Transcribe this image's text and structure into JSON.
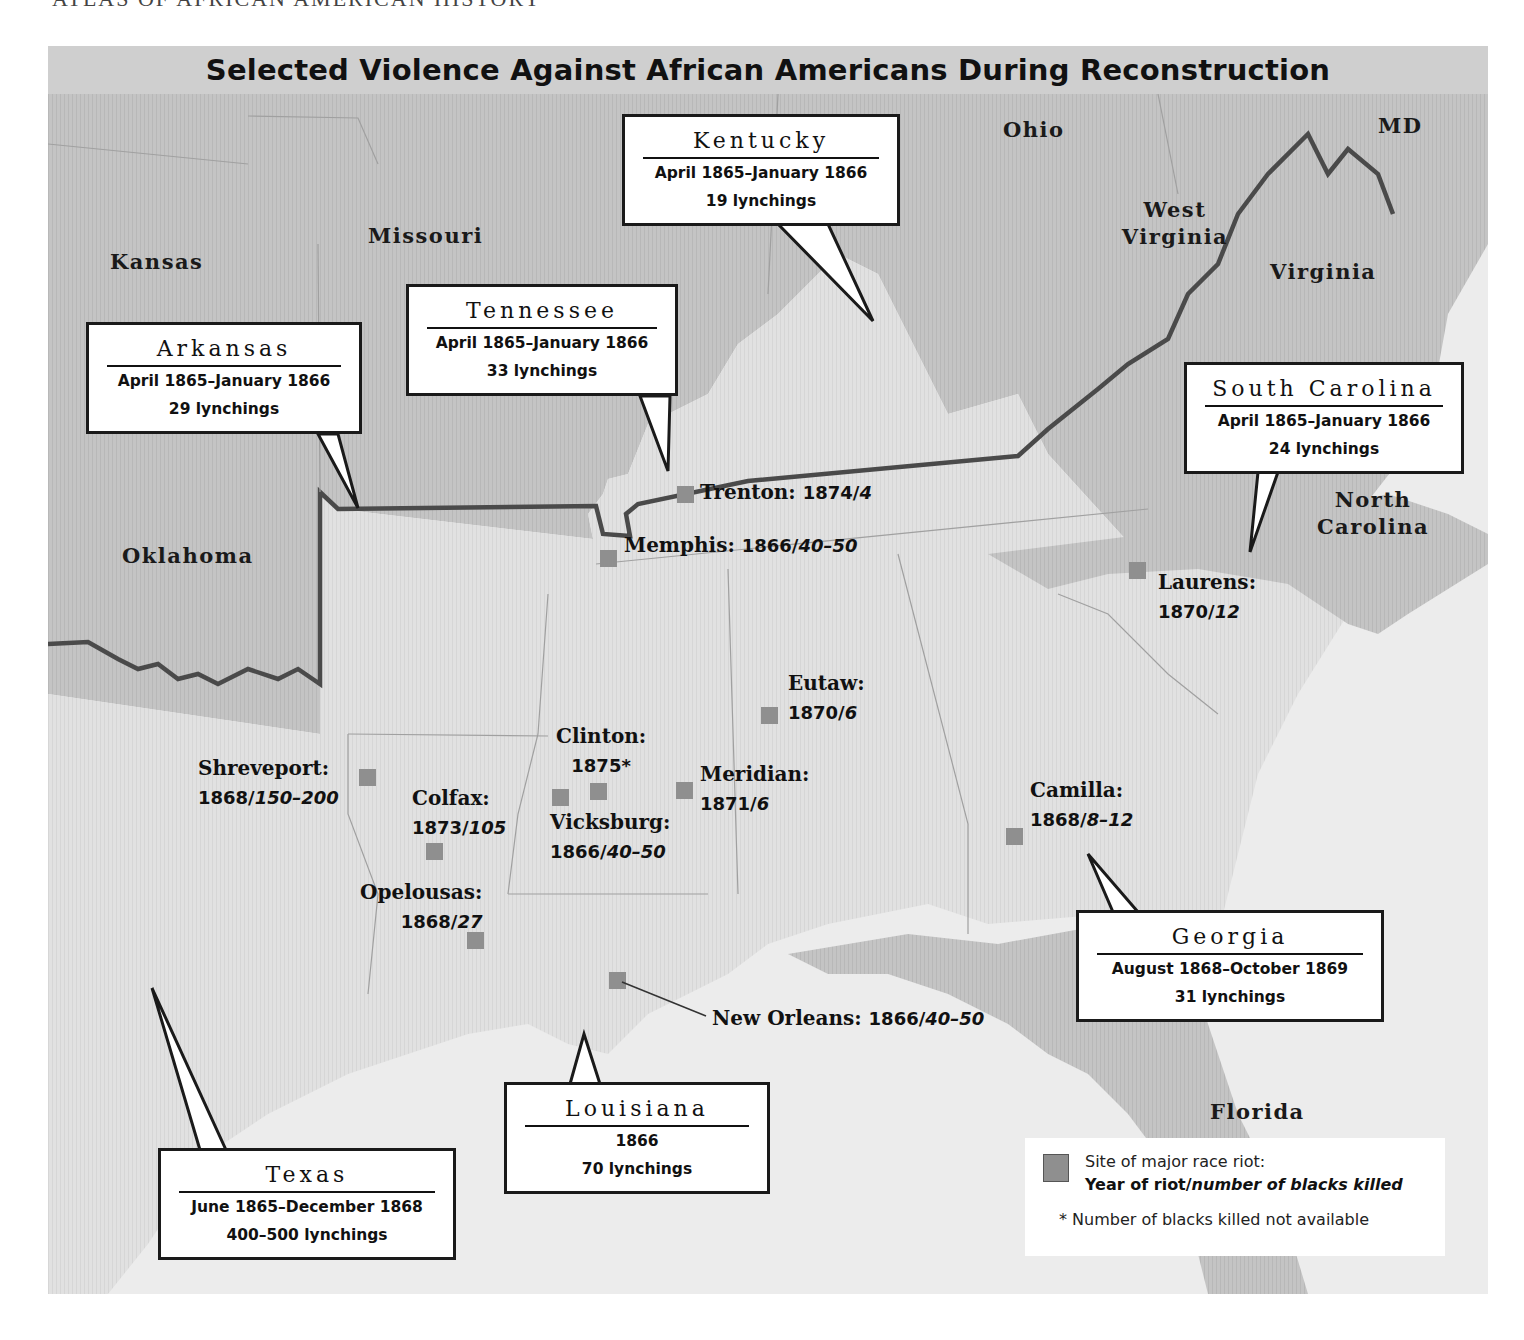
{
  "page": {
    "running_head": "ATLAS OF AFRICAN AMERICAN HISTORY"
  },
  "map": {
    "title": "Selected Violence Against African Americans During Reconstruction",
    "colors": {
      "union_states": "#c2c2c2",
      "former_confederacy": "#e1e1e1",
      "ocean": "#ececec",
      "riot_marker": "#8f8f8f",
      "border_line": "#4a4a4a"
    },
    "state_labels": [
      {
        "id": "kansas",
        "text": "Kansas"
      },
      {
        "id": "missouri",
        "text": "Missouri"
      },
      {
        "id": "ohio",
        "text": "Ohio"
      },
      {
        "id": "md",
        "text": "MD"
      },
      {
        "id": "west-virginia",
        "text": "West Virginia"
      },
      {
        "id": "virginia",
        "text": "Virginia"
      },
      {
        "id": "oklahoma",
        "text": "Oklahoma"
      },
      {
        "id": "north-carolina",
        "text": "North Carolina"
      },
      {
        "id": "florida",
        "text": "Florida"
      }
    ],
    "callouts": [
      {
        "id": "kentucky",
        "state": "Kentucky",
        "period": "April 1865–January 1866",
        "count": "19 lynchings"
      },
      {
        "id": "tennessee",
        "state": "Tennessee",
        "period": "April 1865–January 1866",
        "count": "33 lynchings"
      },
      {
        "id": "arkansas",
        "state": "Arkansas",
        "period": "April 1865–January 1866",
        "count": "29 lynchings"
      },
      {
        "id": "south-carolina",
        "state": "South Carolina",
        "period": "April 1865–January 1866",
        "count": "24 lynchings"
      },
      {
        "id": "georgia",
        "state": "Georgia",
        "period": "August 1868–October 1869",
        "count": "31 lynchings"
      },
      {
        "id": "louisiana",
        "state": "Louisiana",
        "period": "1866",
        "count": "70 lynchings"
      },
      {
        "id": "texas",
        "state": "Texas",
        "period": "June 1865–December 1868",
        "count": "400–500 lynchings"
      }
    ],
    "riot_sites": [
      {
        "id": "trenton",
        "name": "Trenton:",
        "year": "1874/",
        "killed": "4"
      },
      {
        "id": "memphis",
        "name": "Memphis:",
        "year": "1866/",
        "killed": "40–50"
      },
      {
        "id": "laurens",
        "name": "Laurens:",
        "year": "1870/",
        "killed": "12"
      },
      {
        "id": "eutaw",
        "name": "Eutaw:",
        "year": "1870/",
        "killed": "6"
      },
      {
        "id": "clinton",
        "name": "Clinton:",
        "year": "1875*",
        "killed": ""
      },
      {
        "id": "meridian",
        "name": "Meridian:",
        "year": "1871/",
        "killed": "6"
      },
      {
        "id": "shreveport",
        "name": "Shreveport:",
        "year": "1868/",
        "killed": "150–200"
      },
      {
        "id": "colfax",
        "name": "Colfax:",
        "year": "1873/",
        "killed": "105"
      },
      {
        "id": "vicksburg",
        "name": "Vicksburg:",
        "year": "1866/",
        "killed": "40–50"
      },
      {
        "id": "camilla",
        "name": "Camilla:",
        "year": "1868/",
        "killed": "8–12"
      },
      {
        "id": "opelousas",
        "name": "Opelousas:",
        "year": "1868/",
        "killed": "27"
      },
      {
        "id": "new-orleans",
        "name": "New Orleans:",
        "year": "1866/",
        "killed": "40–50"
      }
    ],
    "legend": {
      "marker_label": "Site of major race riot:",
      "format_bold": "Year of riot/",
      "format_italic": "number of blacks killed",
      "footnote": "* Number of blacks killed not available"
    }
  }
}
